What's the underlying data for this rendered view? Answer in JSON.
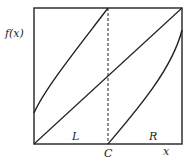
{
  "diagram": {
    "type": "piecewise-map",
    "y_axis_label": "f(x)",
    "x_axis_label": "x",
    "critical_point_label": "C",
    "left_interval_label": "L",
    "right_interval_label": "R",
    "colors": {
      "line": "#222222",
      "background": "#ffffff"
    }
  }
}
